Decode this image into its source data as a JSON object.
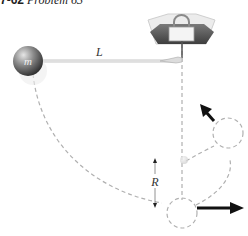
{
  "figure": {
    "title_number": "7-62",
    "title_text": "Problem 63"
  },
  "labels": {
    "mass": "m",
    "length": "L",
    "radius": "R"
  },
  "colors": {
    "dashed_path": "#b0b0b0",
    "arrow": "#111111",
    "ball_dark": "#3a3a3a",
    "ball_light": "#d8d8d8",
    "clamp": "#5a5a5a"
  }
}
